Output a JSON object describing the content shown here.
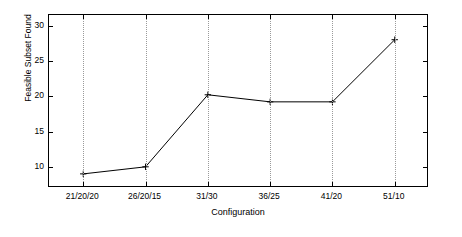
{
  "chart_data": {
    "type": "line",
    "title": "",
    "xlabel": "Configuration",
    "ylabel": "Feasible Subset Found",
    "categories": [
      "21/20/20",
      "26/20/15",
      "31/30",
      "36/25",
      "41/20",
      "51/10"
    ],
    "values": [
      9,
      10,
      20.2,
      19.2,
      19.2,
      28
    ],
    "x_tick_labels": [
      "21/20/20",
      "26/20/15",
      "31/30",
      "36/25",
      "41/20",
      "51/10"
    ],
    "y_tick_labels": [
      "10",
      "15",
      "20",
      "25",
      "30"
    ],
    "y_ticks": [
      10,
      15,
      20,
      25,
      30
    ],
    "ylim": [
      7.0,
      31.5
    ],
    "xlim": [
      0.45,
      6.55
    ],
    "grid": "vertical-dotted",
    "legend": "none",
    "marker": "plus",
    "line_color": "#000000",
    "marker_color": "#000000",
    "grid_color": "#9a9a9a",
    "axis_color": "#000000",
    "background": "#ffffff"
  }
}
